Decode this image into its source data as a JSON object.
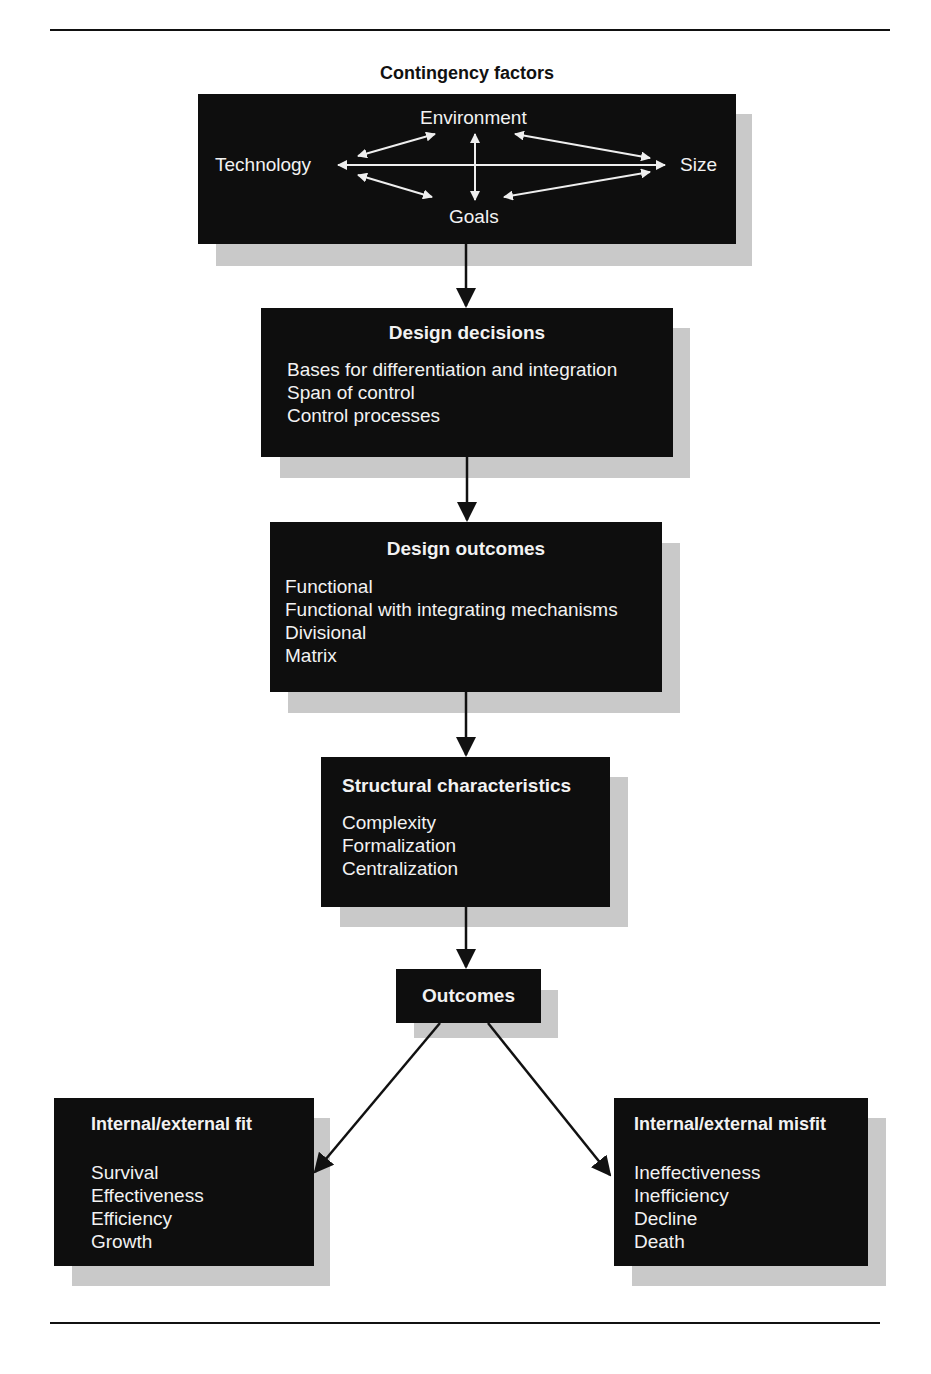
{
  "contingency": {
    "heading": "Contingency factors",
    "factors": {
      "environment": "Environment",
      "technology": "Technology",
      "size": "Size",
      "goals": "Goals"
    }
  },
  "design_decisions": {
    "title": "Design decisions",
    "items": [
      "Bases for differentiation and integration",
      "Span of control",
      "Control processes"
    ]
  },
  "design_outcomes": {
    "title": "Design outcomes",
    "items": [
      "Functional",
      "Functional with integrating mechanisms",
      "Divisional",
      "Matrix"
    ]
  },
  "structural": {
    "title": "Structural characteristics",
    "items": [
      "Complexity",
      "Formalization",
      "Centralization"
    ]
  },
  "outcomes": {
    "title": "Outcomes"
  },
  "fit": {
    "title": "Internal/external fit",
    "items": [
      "Survival",
      "Effectiveness",
      "Efficiency",
      "Growth"
    ]
  },
  "misfit": {
    "title": "Internal/external misfit",
    "items": [
      "Ineffectiveness",
      "Inefficiency",
      "Decline",
      "Death"
    ]
  }
}
